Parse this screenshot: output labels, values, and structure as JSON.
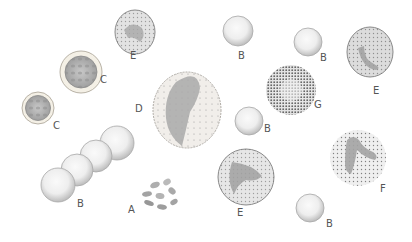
{
  "figure": {
    "labels": {
      "A": "A",
      "B": "B",
      "C": "C",
      "D": "D",
      "E": "E",
      "F": "F",
      "G": "G"
    },
    "cells": [
      {
        "id": "E1",
        "type": "E",
        "label": "E",
        "x": 135,
        "y": 32,
        "r": 21,
        "label_x": 127,
        "label_y": 54
      },
      {
        "id": "C1",
        "type": "C",
        "label": "C",
        "x": 81,
        "y": 72,
        "r": 20,
        "label_x": 100,
        "label_y": 76
      },
      {
        "id": "C2",
        "type": "C",
        "label": "C",
        "x": 38,
        "y": 108,
        "r": 16,
        "label_x": 51,
        "label_y": 124
      },
      {
        "id": "D1",
        "type": "D",
        "label": "D",
        "x": 187,
        "y": 110,
        "r": 36,
        "label_x": 136,
        "label_y": 104
      },
      {
        "id": "B1",
        "type": "B",
        "label": "B",
        "x": 238,
        "y": 31,
        "r": 15,
        "label_x": 240,
        "label_y": 51
      },
      {
        "id": "B2",
        "type": "B",
        "label": "B",
        "x": 308,
        "y": 42,
        "r": 13,
        "label_x": 320,
        "label_y": 53
      },
      {
        "id": "G1",
        "type": "G",
        "label": "G",
        "x": 291,
        "y": 90,
        "r": 25,
        "label_x": 312,
        "label_y": 101
      },
      {
        "id": "E2",
        "type": "E",
        "label": "E",
        "x": 370,
        "y": 51,
        "r": 24,
        "label_x": 372,
        "label_y": 86
      },
      {
        "id": "B3",
        "type": "B",
        "label": "B",
        "x": 249,
        "y": 121,
        "r": 14,
        "label_x": 265,
        "label_y": 126
      },
      {
        "id": "E3",
        "type": "E",
        "label": "E",
        "x": 246,
        "y": 177,
        "r": 28,
        "label_x": 232,
        "label_y": 208
      },
      {
        "id": "F1",
        "type": "F",
        "label": "F",
        "x": 358,
        "y": 158,
        "r": 28,
        "label_x": 380,
        "label_y": 185
      },
      {
        "id": "B4",
        "type": "B",
        "label": "B",
        "x": 310,
        "y": 209,
        "r": 14,
        "label_x": 323,
        "label_y": 220
      },
      {
        "id": "A1",
        "type": "A",
        "label": "A",
        "x": 158,
        "y": 192,
        "r": 18,
        "label_x": 129,
        "label_y": 203
      }
    ],
    "rouleaux": {
      "label": "B",
      "label_x": 76,
      "label_y": 200,
      "discs": [
        {
          "x": 58,
          "y": 185,
          "r": 17
        },
        {
          "x": 77,
          "y": 170,
          "r": 16
        },
        {
          "x": 96,
          "y": 156,
          "r": 16
        },
        {
          "x": 117,
          "y": 143,
          "r": 16
        }
      ]
    },
    "colors": {
      "outline": "#8a8a8a",
      "rbc_fill": "#ececec",
      "rbc_edge": "#bdbdbd",
      "granule": "#5a5a5a",
      "nucleus": "#9a9a9a",
      "label": "#555555"
    }
  }
}
